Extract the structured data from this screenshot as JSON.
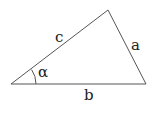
{
  "diagram": {
    "type": "triangle",
    "vertices": {
      "A": [
        11,
        84
      ],
      "B": [
        146,
        84
      ],
      "C": [
        108,
        10
      ]
    },
    "labels": {
      "side_c": "c",
      "side_a": "a",
      "side_b": "b",
      "angle_alpha": "α"
    },
    "stroke_color": "#555555"
  }
}
